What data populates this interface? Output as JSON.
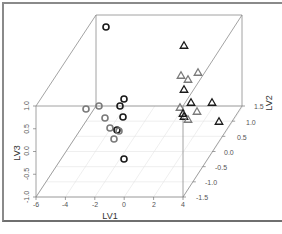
{
  "chart_data": {
    "type": "scatter",
    "projection": "3d",
    "title": "",
    "xlabel": "LV1",
    "ylabel": "LV2",
    "zlabel": "LV3",
    "xlim": [
      -6,
      4
    ],
    "ylim": [
      -1.5,
      1.5
    ],
    "zlim": [
      -1.0,
      1.0
    ],
    "x_ticks": [
      "-6",
      "-4",
      "-2",
      "0",
      "2",
      "4"
    ],
    "y_ticks": [
      "-1.5",
      "-1.0",
      "-0.5",
      "0.0",
      "0.5",
      "1.0",
      "1.5"
    ],
    "z_ticks": [
      "-1.0",
      "-0.5",
      "0.0",
      "0.5",
      "1.0"
    ],
    "grid": true,
    "legend": null,
    "series": [
      {
        "name": "group-circles",
        "marker": "circle",
        "points_px": [
          {
            "x": 106,
            "y": 27,
            "shade": "dark"
          },
          {
            "x": 86,
            "y": 109,
            "shade": "light"
          },
          {
            "x": 99,
            "y": 106,
            "shade": "light"
          },
          {
            "x": 124,
            "y": 99,
            "shade": "dark"
          },
          {
            "x": 120,
            "y": 106,
            "shade": "dark"
          },
          {
            "x": 105,
            "y": 118,
            "shade": "light"
          },
          {
            "x": 123,
            "y": 117,
            "shade": "dark"
          },
          {
            "x": 110,
            "y": 128,
            "shade": "light"
          },
          {
            "x": 117,
            "y": 130,
            "shade": "dark"
          },
          {
            "x": 119,
            "y": 131,
            "shade": "light"
          },
          {
            "x": 114,
            "y": 139,
            "shade": "light"
          },
          {
            "x": 124,
            "y": 159,
            "shade": "dark"
          }
        ]
      },
      {
        "name": "group-triangles",
        "marker": "triangle",
        "points_px": [
          {
            "x": 184,
            "y": 45,
            "shade": "dark"
          },
          {
            "x": 181,
            "y": 75,
            "shade": "light"
          },
          {
            "x": 188,
            "y": 79,
            "shade": "light"
          },
          {
            "x": 198,
            "y": 72,
            "shade": "light"
          },
          {
            "x": 184,
            "y": 89,
            "shade": "dark"
          },
          {
            "x": 191,
            "y": 102,
            "shade": "dark"
          },
          {
            "x": 212,
            "y": 102,
            "shade": "dark"
          },
          {
            "x": 180,
            "y": 107,
            "shade": "light"
          },
          {
            "x": 197,
            "y": 111,
            "shade": "light"
          },
          {
            "x": 183,
            "y": 113,
            "shade": "dark"
          },
          {
            "x": 184,
            "y": 116,
            "shade": "dark"
          },
          {
            "x": 188,
            "y": 119,
            "shade": "light"
          },
          {
            "x": 219,
            "y": 121,
            "shade": "dark"
          }
        ]
      }
    ]
  },
  "labels": {
    "xlabel": "LV1",
    "ylabel": "LV2",
    "zlabel": "LV3"
  }
}
